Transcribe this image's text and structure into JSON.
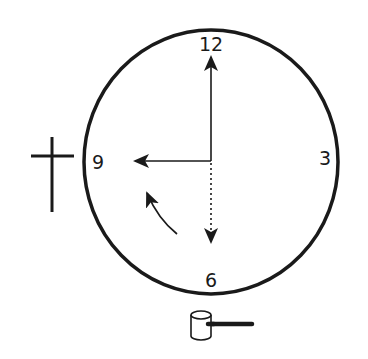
{
  "diagram": {
    "type": "clock-face",
    "colors": {
      "ink": "#1a1a1a",
      "background": "#ffffff"
    },
    "numerals": {
      "twelve": "12",
      "three": "3",
      "six": "6",
      "nine": "9"
    },
    "hands": [
      {
        "name": "hand-to-12",
        "direction": "up",
        "style": "solid"
      },
      {
        "name": "hand-to-9",
        "direction": "left",
        "style": "solid"
      },
      {
        "name": "hand-to-6",
        "direction": "down",
        "style": "dotted"
      }
    ],
    "annotations": [
      {
        "name": "rotation-arrow",
        "description": "curved arrow indicating counterclockwise motion from 6 toward 9"
      },
      {
        "name": "cross-symbol",
        "position": "left of 9"
      },
      {
        "name": "hammer-symbol",
        "position": "below 6"
      }
    ]
  }
}
